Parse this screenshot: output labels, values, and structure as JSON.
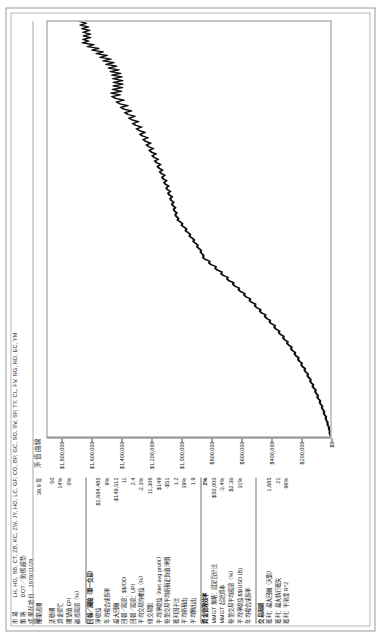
{
  "header": {
    "market_label": "市場",
    "market_value": "LH, HG, SB, CT, ZB, KC, ZW, JY, HO, LC, GF, CO, BP, GC, SO, SV, SP, TY, CL, FV, NG, ND, EC, YM",
    "strategy_label": "策略",
    "strategy_value": "DOT／動態趨勢",
    "start_date_label": "成果起始日期",
    "start_date_value": "1979/11/29",
    "duration_label": "成果週期",
    "duration_value": "39.9 年"
  },
  "stats": {
    "group1": [
      {
        "label": "活動期",
        "value": "50"
      },
      {
        "label": "資金單位",
        "value": "14%"
      },
      {
        "label": "期望值 EPI",
        "value": "0%"
      },
      {
        "label": "破產風險（%）",
        "value": ""
      }
    ],
    "group2_head": {
      "label": "回報／風險（單一交易）",
      "value": ""
    },
    "group2": [
      {
        "label": "淨收益",
        "value": "$1,684,485"
      },
      {
        "label": "年均複合成長率",
        "value": "9%"
      },
      {
        "label": "最大回撤",
        "value": "-$149,512"
      },
      {
        "label": "回報／風險：$$/DD",
        "value": "11"
      },
      {
        "label": "回報／風險：UPI",
        "value": "2.4"
      },
      {
        "label": "平均交易的權益（%）",
        "value": "-2.3%"
      },
      {
        "label": "總交易數",
        "value": "11,306"
      },
      {
        "label": "平均淨收益（Net avg profit）",
        "value": "$149"
      },
      {
        "label": "每筆交易平均虧損正負值淨價",
        "value": "-$51"
      },
      {
        "label": "獲利因子比",
        "value": "1.2"
      },
      {
        "label": "平均虧損出",
        "value": "39%"
      },
      {
        "label": "平均勝出出",
        "value": "1.9"
      }
    ],
    "group3_head": {
      "label": "資金管理效率",
      "value": "2%"
    },
    "group3": [
      {
        "label": "MMGT 策略：固定百分比",
        "value": "$50,000"
      },
      {
        "label": "MMGT 起始資本",
        "value": "-3.4%"
      },
      {
        "label": "每筆交易平均風險（%）",
        "value": "$2.3b"
      },
      {
        "label": "平均淨收益 $$/USD (B)",
        "value": "31%"
      },
      {
        "label": "年均複合成長率",
        "value": ""
      }
    ],
    "group4_head": {
      "label": "交易周期",
      "value": ""
    },
    "group4": [
      {
        "label": "獲利：最大回撤（天數）",
        "value": "1,685"
      },
      {
        "label": "獲利：最大執行獲失",
        "value": "21"
      },
      {
        "label": "獲利：平滑度 R^2",
        "value": "96%"
      }
    ]
  },
  "chart_data": {
    "type": "line",
    "title": "淨值曲線",
    "xlabel": "",
    "ylabel": "",
    "ylim": [
      0,
      1900000
    ],
    "yticks": [
      0,
      200000,
      400000,
      600000,
      800000,
      1000000,
      1200000,
      1400000,
      1600000,
      1800000
    ],
    "ytick_labels": [
      "$0",
      "$200,000",
      "$400,000",
      "$600,000",
      "$800,000",
      "$1,000,000",
      "$1,200,000",
      "$1,400,000",
      "$1,600,000",
      "$1,800,000"
    ],
    "grid": false,
    "legend": "none",
    "series": [
      {
        "name": "淨值曲線",
        "values": [
          0,
          2000,
          6000,
          4000,
          11000,
          9000,
          16000,
          21000,
          19000,
          27000,
          33000,
          30000,
          39000,
          45000,
          42000,
          52000,
          58000,
          55000,
          66000,
          72000,
          69000,
          80000,
          88000,
          84000,
          95000,
          103000,
          99000,
          112000,
          120000,
          116000,
          129000,
          137000,
          133000,
          147000,
          155000,
          151000,
          166000,
          175000,
          171000,
          187000,
          196000,
          192000,
          208000,
          218000,
          214000,
          231000,
          241000,
          237000,
          255000,
          265000,
          261000,
          280000,
          291000,
          287000,
          307000,
          318000,
          314000,
          335000,
          347000,
          343000,
          365000,
          377000,
          373000,
          396000,
          409000,
          405000,
          428000,
          441000,
          437000,
          461000,
          474000,
          470000,
          495000,
          508000,
          504000,
          530000,
          543000,
          539000,
          566000,
          580000,
          576000,
          603000,
          617000,
          613000,
          641000,
          655000,
          651000,
          680000,
          694000,
          690000,
          719000,
          734000,
          730000,
          759000,
          774000,
          770000,
          800000,
          815000,
          811000,
          841000,
          856000,
          852000,
          860000,
          872000,
          869000,
          882000,
          896000,
          891000,
          905000,
          921000,
          916000,
          930000,
          947000,
          941000,
          956000,
          973000,
          967000,
          982000,
          1000000,
          994000,
          1009000,
          1027000,
          1021000,
          1036000,
          1042000,
          1031000,
          1047000,
          1053000,
          1041000,
          1058000,
          1065000,
          1052000,
          1070000,
          1077000,
          1063000,
          1082000,
          1090000,
          1075000,
          1095000,
          1103000,
          1087000,
          1108000,
          1117000,
          1100000,
          1122000,
          1131000,
          1113000,
          1136000,
          1146000,
          1127000,
          1151000,
          1162000,
          1141000,
          1167000,
          1179000,
          1157000,
          1184000,
          1197000,
          1173000,
          1202000,
          1216000,
          1190000,
          1221000,
          1236000,
          1208000,
          1241000,
          1257000,
          1226000,
          1262000,
          1279000,
          1246000,
          1284000,
          1302000,
          1268000,
          1308000,
          1327000,
          1290000,
          1333000,
          1353000,
          1313000,
          1359000,
          1380000,
          1337000,
          1386000,
          1408000,
          1362000,
          1414000,
          1437000,
          1388000,
          1443000,
          1467000,
          1414000,
          1473000,
          1404000,
          1462000,
          1398000,
          1458000,
          1395000,
          1457000,
          1396000,
          1460000,
          1401000,
          1467000,
          1410000,
          1477000,
          1422000,
          1490000,
          1437000,
          1506000,
          1455000,
          1525000,
          1476000,
          1547000,
          1500000,
          1572000,
          1527000,
          1600000,
          1557000,
          1631000,
          1590000,
          1665000,
          1626000,
          1660000,
          1612000,
          1658000,
          1613000,
          1661000,
          1618000,
          1668000,
          1627000,
          1679000,
          1640000,
          1684485
        ]
      }
    ]
  }
}
